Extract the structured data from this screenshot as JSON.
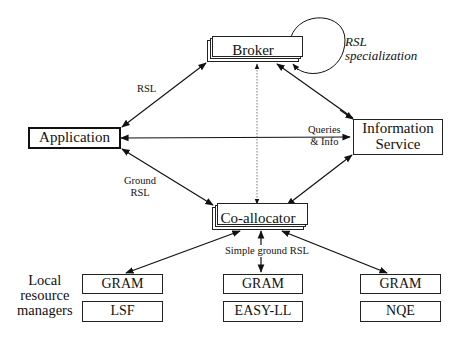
{
  "diagram": {
    "nodes": {
      "broker": "Broker",
      "application": "Application",
      "information_service_line1": "Information",
      "information_service_line2": "Service",
      "coallocator": "Co-allocator",
      "gram1": "GRAM",
      "lsf": "LSF",
      "gram2": "GRAM",
      "easyll": "EASY-LL",
      "gram3": "GRAM",
      "nqe": "NQE"
    },
    "labels": {
      "rsl": "RSL",
      "rsl_spec_line1": "RSL",
      "rsl_spec_line2": "specialization",
      "queries_line1": "Queries",
      "queries_line2": "& Info",
      "ground_rsl_line1": "Ground",
      "ground_rsl_line2": "RSL",
      "simple_ground_rsl": "Simple ground RSL",
      "local_rm_line1": "Local",
      "local_rm_line2": "resource",
      "local_rm_line3": "managers"
    }
  }
}
